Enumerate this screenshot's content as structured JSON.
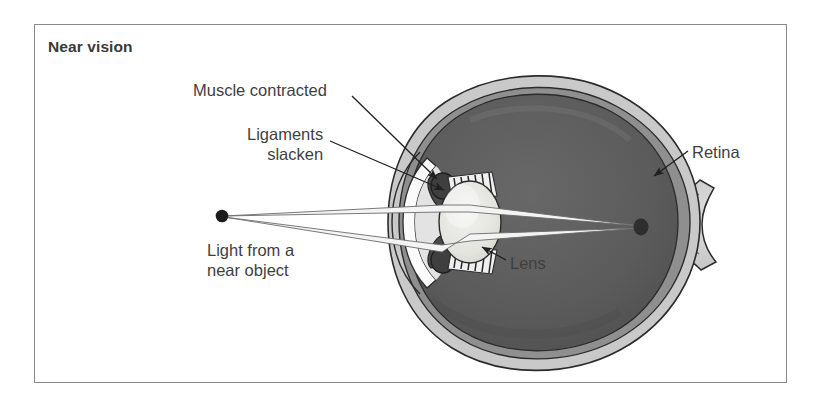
{
  "figure": {
    "panel_title": "Near vision",
    "frame_border_color": "#8a8a8a",
    "background_color": "#ffffff"
  },
  "labels": {
    "muscle": "Muscle contracted",
    "ligaments_line1": "Ligaments",
    "ligaments_line2": "slacken",
    "retina": "Retina",
    "lens": "Lens",
    "light_line1": "Light from a",
    "light_line2": "near object"
  },
  "diagram": {
    "state": "accommodated-for-near-vision",
    "colors": {
      "sclera": "#c9c9c9",
      "choroid": "#8f8f8f",
      "vitreous": "#5a5a5a",
      "lens": "#e8e8e4",
      "cornea": "#fbfbfb",
      "iris": "#4a4a4a",
      "ray": "#f2f2f2",
      "outline": "#2b2b2b",
      "focal_point": "#2e2e2e",
      "light_source": "#1c1c1c"
    },
    "parts": [
      "sclera",
      "choroid",
      "retina",
      "vitreous-body",
      "lens",
      "cornea",
      "iris",
      "ciliary-muscle",
      "suspensory-ligaments",
      "optic-nerve"
    ],
    "light_source_point": {
      "x": 222,
      "y": 216
    },
    "focal_point": {
      "x": 641,
      "y": 227
    },
    "ray_count": 2
  }
}
